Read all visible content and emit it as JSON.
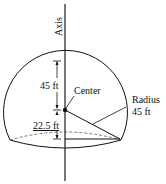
{
  "diagram": {
    "axis_label": "Axis",
    "center_label": "Center",
    "radius_label_line1": "Radius",
    "radius_label_line2": "45 ft",
    "upper_dimension": "45 ft",
    "lower_dimension": "22.5 ft",
    "colors": {
      "stroke": "#111111",
      "axis": "#777777",
      "dashed": "#555555"
    }
  }
}
